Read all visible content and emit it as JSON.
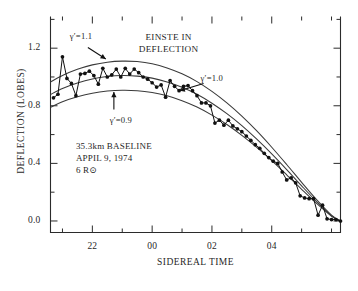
{
  "figure": {
    "name": "solar-deflection-vlbi-plot"
  },
  "chart_data": {
    "type": "line",
    "title": "",
    "xlabel": "SIDEREAL TIME",
    "ylabel": "DEFLECTION (LOBES)",
    "xlim": [
      20.6,
      6.3
    ],
    "ylim": [
      -0.08,
      1.42
    ],
    "grid": false,
    "legend_position": "none",
    "x_ticks_major": [
      22,
      0,
      2,
      4
    ],
    "x_tick_labels": [
      "22",
      "00",
      "02",
      "04"
    ],
    "x_ticks_minor": [
      21,
      23,
      1,
      3,
      5,
      6
    ],
    "y_ticks_major": [
      0.0,
      0.4,
      0.8,
      1.2
    ],
    "y_tick_labels": [
      "0.0",
      "0.4",
      "0.8",
      "1.2"
    ],
    "y_ticks_minor": [
      0.2,
      0.6,
      1.0,
      1.4
    ],
    "annotations": [
      {
        "id": "gamma-11",
        "text": "γ′=1.1",
        "x": 21.5,
        "y": 1.24,
        "points_to": [
          22.6,
          1.1
        ]
      },
      {
        "id": "gamma-10",
        "text": "γ′=1.0",
        "x": 1.9,
        "y": 0.96,
        "points_to": [
          0.85,
          0.88
        ]
      },
      {
        "id": "gamma-09",
        "text": "γ′=0.9",
        "x": 22.5,
        "y": 0.7,
        "points_to": [
          22.7,
          0.855
        ]
      },
      {
        "id": "einstein-deflection",
        "text": "EINSTE IN DEFLECTION",
        "x": 0.3,
        "y": 1.25
      },
      {
        "id": "observation-note",
        "text": "35.3km BASELINE APPIL 9, 1974 6 R⊙",
        "x": 21.6,
        "y": 0.47
      }
    ],
    "annotation_lines": {
      "gamma_11": "γ′=1.1",
      "gamma_10": "γ′=1.0",
      "gamma_09": "γ′=0.9",
      "einstein_line1": "EINSTE IN",
      "einstein_line2": "DEFLECTION",
      "note_line1": "35.3km BASELINE",
      "note_line2": "APPIL 9, 1974",
      "note_line3": "6 R⊙"
    },
    "series": [
      {
        "name": "γ′=1.1",
        "kind": "model-curve",
        "color": "#3a3a3a",
        "x": [
          20.6,
          21.0,
          21.5,
          22.0,
          22.5,
          23.0,
          23.5,
          0.0,
          0.5,
          1.0,
          1.5,
          2.0,
          2.5,
          3.0,
          3.5,
          4.0,
          4.5,
          5.0,
          5.5,
          6.0,
          6.3
        ],
        "y": [
          0.965,
          1.01,
          1.053,
          1.084,
          1.103,
          1.11,
          1.107,
          1.092,
          1.063,
          1.022,
          0.968,
          0.9,
          0.82,
          0.728,
          0.625,
          0.512,
          0.392,
          0.268,
          0.148,
          0.04,
          0.0
        ]
      },
      {
        "name": "γ′=1.0",
        "kind": "model-curve",
        "color": "#3a3a3a",
        "x": [
          20.6,
          21.0,
          21.5,
          22.0,
          22.5,
          23.0,
          23.5,
          0.0,
          0.5,
          1.0,
          1.5,
          2.0,
          2.5,
          3.0,
          3.5,
          4.0,
          4.5,
          5.0,
          5.5,
          6.0,
          6.3
        ],
        "y": [
          0.878,
          0.92,
          0.958,
          0.986,
          1.003,
          1.01,
          1.006,
          0.992,
          0.966,
          0.929,
          0.88,
          0.818,
          0.745,
          0.662,
          0.568,
          0.466,
          0.357,
          0.244,
          0.135,
          0.036,
          0.0
        ]
      },
      {
        "name": "γ′=0.9",
        "kind": "model-curve",
        "color": "#3a3a3a",
        "x": [
          20.6,
          21.0,
          21.5,
          22.0,
          22.5,
          23.0,
          23.5,
          0.0,
          0.5,
          1.0,
          1.5,
          2.0,
          2.5,
          3.0,
          3.5,
          4.0,
          4.5,
          5.0,
          5.5,
          6.0,
          6.3
        ],
        "y": [
          0.79,
          0.828,
          0.862,
          0.887,
          0.902,
          0.908,
          0.905,
          0.892,
          0.869,
          0.835,
          0.791,
          0.735,
          0.67,
          0.595,
          0.511,
          0.419,
          0.321,
          0.22,
          0.122,
          0.033,
          0.0
        ]
      },
      {
        "name": "observed deflection",
        "kind": "data",
        "color": "#111111",
        "marker": "filled-circle",
        "x": [
          20.7,
          20.85,
          21.0,
          21.15,
          21.3,
          21.45,
          21.6,
          21.75,
          21.9,
          22.05,
          22.2,
          22.35,
          22.5,
          22.65,
          22.8,
          22.95,
          23.1,
          23.25,
          23.4,
          23.55,
          23.7,
          23.85,
          0.0,
          0.15,
          0.3,
          0.45,
          0.6,
          0.75,
          0.9,
          1.05,
          1.2,
          1.35,
          1.5,
          1.65,
          1.8,
          1.95,
          2.1,
          2.25,
          2.4,
          2.55,
          2.7,
          2.85,
          3.0,
          3.15,
          3.3,
          3.45,
          3.6,
          3.75,
          3.9,
          4.05,
          4.2,
          4.35,
          4.5,
          4.65,
          4.8,
          4.95,
          5.1,
          5.25,
          5.4,
          5.55,
          5.7,
          5.85,
          6.0,
          6.15,
          6.3
        ],
        "y": [
          0.855,
          0.88,
          1.14,
          0.99,
          0.955,
          0.87,
          1.02,
          1.025,
          1.04,
          1.01,
          0.95,
          1.06,
          1.0,
          1.015,
          1.055,
          1.0,
          1.06,
          1.02,
          1.055,
          1.03,
          1.0,
          0.985,
          0.96,
          0.93,
          0.945,
          0.86,
          0.975,
          0.935,
          0.905,
          0.935,
          0.94,
          0.905,
          0.87,
          0.82,
          0.82,
          0.8,
          0.68,
          0.7,
          0.665,
          0.7,
          0.66,
          0.64,
          0.62,
          0.59,
          0.56,
          0.53,
          0.505,
          0.47,
          0.44,
          0.415,
          0.4,
          0.34,
          0.285,
          0.3,
          0.265,
          0.175,
          0.16,
          0.155,
          0.155,
          0.04,
          0.11,
          0.015,
          0.01,
          0.01,
          0.0
        ]
      }
    ]
  }
}
